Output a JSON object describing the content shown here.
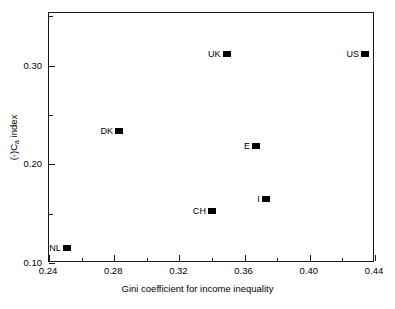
{
  "chart_data": {
    "type": "scatter",
    "title": "",
    "xlabel": "Gini coefficient for income inequality",
    "ylabel_prefix": "(-)C",
    "ylabel_sub": "a",
    "ylabel_suffix": " index",
    "xlim": [
      0.24,
      0.44
    ],
    "ylim": [
      0.1,
      0.3535
    ],
    "grid": false,
    "legend": "none",
    "xticks_major": [
      0.24,
      0.28,
      0.32,
      0.36,
      0.4,
      0.44
    ],
    "xticks_major_labels": [
      "0.24",
      "0.28",
      "0.32",
      "0.36",
      "0.40",
      "0.44"
    ],
    "xticks_minor": [
      0.26,
      0.3,
      0.34,
      0.38,
      0.42
    ],
    "yticks_major": [
      0.1,
      0.2,
      0.3
    ],
    "yticks_major_labels": [
      "0.10",
      "0.20",
      "0.30"
    ],
    "yticks_minor": [
      0.15,
      0.25,
      0.35
    ],
    "marker_color": "#000000",
    "marker_shape": "square",
    "points": [
      {
        "label": "UK",
        "x": 0.349,
        "y": 0.312
      },
      {
        "label": "US",
        "x": 0.434,
        "y": 0.312
      },
      {
        "label": "DK",
        "x": 0.283,
        "y": 0.234
      },
      {
        "label": "E",
        "x": 0.367,
        "y": 0.219
      },
      {
        "label": "I",
        "x": 0.373,
        "y": 0.165
      },
      {
        "label": "CH",
        "x": 0.34,
        "y": 0.153
      },
      {
        "label": "NL",
        "x": 0.251,
        "y": 0.115
      }
    ]
  }
}
